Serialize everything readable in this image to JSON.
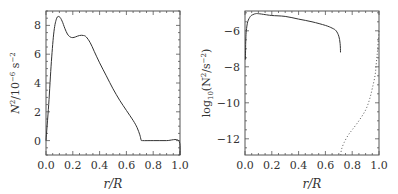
{
  "chart_data": [
    {
      "type": "line",
      "title": "",
      "xlabel": "r/R",
      "ylabel": "N^2/10^-6 s^-2",
      "xlim": [
        0.0,
        1.0
      ],
      "ylim": [
        -1,
        9
      ],
      "xticks": [
        "0.0",
        "0.2",
        "0.4",
        "0.6",
        "0.8",
        "1.0"
      ],
      "yticks": [
        "0",
        "2",
        "4",
        "6",
        "8"
      ],
      "grid": false,
      "series": [
        {
          "name": "N^2",
          "style": "solid",
          "x": [
            0.0,
            0.02,
            0.04,
            0.06,
            0.08,
            0.1,
            0.12,
            0.14,
            0.16,
            0.18,
            0.2,
            0.22,
            0.25,
            0.28,
            0.3,
            0.33,
            0.36,
            0.4,
            0.45,
            0.5,
            0.55,
            0.6,
            0.65,
            0.68,
            0.7,
            0.71,
            0.72,
            0.8,
            0.9,
            0.99,
            1.0
          ],
          "values": [
            0.0,
            2.5,
            5.5,
            7.6,
            8.5,
            8.6,
            8.3,
            7.8,
            7.4,
            7.2,
            7.15,
            7.2,
            7.3,
            7.3,
            7.2,
            6.8,
            6.2,
            5.4,
            4.5,
            3.6,
            2.8,
            2.1,
            1.4,
            0.9,
            0.4,
            0.05,
            0.0,
            0.0,
            0.0,
            0.0,
            -1.0
          ]
        }
      ]
    },
    {
      "type": "line",
      "title": "",
      "xlabel": "r/R",
      "ylabel": "log10(N^2/s^-2)",
      "xlim": [
        0.0,
        1.0
      ],
      "ylim": [
        -12.9,
        -4.9
      ],
      "xticks": [
        "0.0",
        "0.2",
        "0.4",
        "0.6",
        "0.8",
        "1.0"
      ],
      "yticks": [
        "-6",
        "-8",
        "-10",
        "-12"
      ],
      "grid": false,
      "series": [
        {
          "name": "log10 N^2 (radiative interior)",
          "style": "solid",
          "x": [
            0.003,
            0.006,
            0.01,
            0.02,
            0.04,
            0.06,
            0.08,
            0.1,
            0.15,
            0.2,
            0.3,
            0.4,
            0.5,
            0.6,
            0.65,
            0.68,
            0.7,
            0.71,
            0.713
          ],
          "values": [
            -7.6,
            -6.5,
            -6.0,
            -5.5,
            -5.2,
            -5.1,
            -5.05,
            -5.05,
            -5.1,
            -5.15,
            -5.2,
            -5.35,
            -5.5,
            -5.7,
            -5.85,
            -6.0,
            -6.3,
            -6.7,
            -7.2
          ]
        },
        {
          "name": "log10 |N^2| (convection zone)",
          "style": "dotted",
          "x": [
            0.715,
            0.72,
            0.74,
            0.77,
            0.8,
            0.85,
            0.9,
            0.93,
            0.95,
            0.97,
            0.98,
            0.99,
            1.0
          ],
          "values": [
            -12.9,
            -12.6,
            -12.2,
            -11.8,
            -11.5,
            -11.0,
            -10.4,
            -9.8,
            -9.2,
            -8.5,
            -7.8,
            -7.0,
            -6.0
          ]
        }
      ]
    }
  ],
  "labels": {
    "left_xlabel": "r/R",
    "right_xlabel": "r/R",
    "left_ylabel_main": "N",
    "left_ylabel_sup": "2",
    "left_ylabel_rest": "/10",
    "left_ylabel_exp": "−6",
    "left_ylabel_unit": " s",
    "left_ylabel_unit_exp": "−2",
    "right_ylabel_prefix": "log",
    "right_ylabel_sub": "10",
    "right_ylabel_open": "(N",
    "right_ylabel_sup": "2",
    "right_ylabel_mid": "/s",
    "right_ylabel_exp": "−2",
    "right_ylabel_close": ")",
    "left_xticks": [
      "0.0",
      "0.2",
      "0.4",
      "0.6",
      "0.8",
      "1.0"
    ],
    "right_xticks": [
      "0.0",
      "0.2",
      "0.4",
      "0.6",
      "0.8",
      "1.0"
    ],
    "left_yticks": [
      "0",
      "2",
      "4",
      "6",
      "8"
    ],
    "right_yticks": [
      "−6",
      "−8",
      "−10",
      "−12"
    ]
  }
}
